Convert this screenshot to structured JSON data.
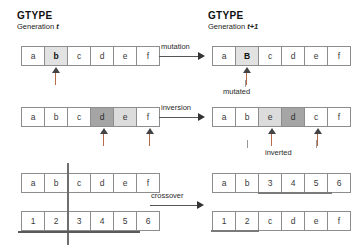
{
  "headers": {
    "left": {
      "title": "GTYPE",
      "generation_prefix": "Generation ",
      "generation_value": "t"
    },
    "right": {
      "title": "GTYPE",
      "generation_prefix": "Generation ",
      "generation_value": "t+1"
    }
  },
  "operators": [
    {
      "name": "mutation",
      "label": "mutation"
    },
    {
      "name": "inversion",
      "label": "inversion"
    },
    {
      "name": "crossover",
      "label": "crossover"
    }
  ],
  "captions": [
    {
      "name": "mutated",
      "label": "mutated"
    },
    {
      "name": "inverted",
      "label": "inverted"
    }
  ],
  "rows": {
    "mutation_before": {
      "name": "parent-mutation",
      "cells": [
        {
          "value": "a",
          "shade": "none"
        },
        {
          "value": "b",
          "shade": "light"
        },
        {
          "value": "c",
          "shade": "none"
        },
        {
          "value": "d",
          "shade": "none"
        },
        {
          "value": "e",
          "shade": "none"
        },
        {
          "value": "f",
          "shade": "none"
        }
      ],
      "markers": [
        1
      ]
    },
    "mutation_after": {
      "name": "child-mutated",
      "cells": [
        {
          "value": "a",
          "shade": "none"
        },
        {
          "value": "B",
          "shade": "light"
        },
        {
          "value": "c",
          "shade": "none"
        },
        {
          "value": "d",
          "shade": "none"
        },
        {
          "value": "e",
          "shade": "none"
        },
        {
          "value": "f",
          "shade": "none"
        }
      ],
      "markers": [
        1
      ]
    },
    "inversion_before": {
      "name": "parent-inversion",
      "cells": [
        {
          "value": "a",
          "shade": "none"
        },
        {
          "value": "b",
          "shade": "none"
        },
        {
          "value": "c",
          "shade": "none"
        },
        {
          "value": "d",
          "shade": "dark"
        },
        {
          "value": "e",
          "shade": "mid"
        },
        {
          "value": "f",
          "shade": "none"
        }
      ],
      "markers": [
        3,
        4
      ]
    },
    "inversion_after": {
      "name": "child-inverted",
      "cells": [
        {
          "value": "a",
          "shade": "none"
        },
        {
          "value": "b",
          "shade": "none"
        },
        {
          "value": "e",
          "shade": "mid"
        },
        {
          "value": "d",
          "shade": "dark"
        },
        {
          "value": "c",
          "shade": "none"
        },
        {
          "value": "f",
          "shade": "none"
        }
      ],
      "markers": [
        2,
        4
      ]
    },
    "crossover_parent_1": {
      "name": "parent-one",
      "cells": [
        {
          "value": "a",
          "shade": "none"
        },
        {
          "value": "b",
          "shade": "none"
        },
        {
          "value": "c",
          "shade": "none"
        },
        {
          "value": "d",
          "shade": "none"
        },
        {
          "value": "e",
          "shade": "none"
        },
        {
          "value": "f",
          "shade": "none"
        }
      ]
    },
    "crossover_parent_2": {
      "name": "parent-two",
      "cells": [
        {
          "value": "1",
          "shade": "none"
        },
        {
          "value": "2",
          "shade": "none"
        },
        {
          "value": "3",
          "shade": "none"
        },
        {
          "value": "4",
          "shade": "none"
        },
        {
          "value": "5",
          "shade": "none"
        },
        {
          "value": "6",
          "shade": "none"
        }
      ]
    },
    "crossover_child_1": {
      "name": "child-one",
      "cells": [
        {
          "value": "a",
          "shade": "none"
        },
        {
          "value": "b",
          "shade": "none"
        },
        {
          "value": "3",
          "shade": "none"
        },
        {
          "value": "4",
          "shade": "none"
        },
        {
          "value": "5",
          "shade": "none"
        },
        {
          "value": "6",
          "shade": "none"
        }
      ]
    },
    "crossover_child_2": {
      "name": "child-two",
      "cells": [
        {
          "value": "1",
          "shade": "none"
        },
        {
          "value": "2",
          "shade": "none"
        },
        {
          "value": "c",
          "shade": "none"
        },
        {
          "value": "d",
          "shade": "none"
        },
        {
          "value": "e",
          "shade": "none"
        },
        {
          "value": "f",
          "shade": "none"
        }
      ]
    }
  },
  "crossover_point_index": 2,
  "colors": {
    "cell_border": "#8d8d8d",
    "shade_light": "#e2e2e2",
    "shade_mid": "#dcdcdc",
    "shade_dark": "#a5a5a5",
    "marker_stem": "#b56a4a",
    "rule": "#6e6e6e"
  }
}
